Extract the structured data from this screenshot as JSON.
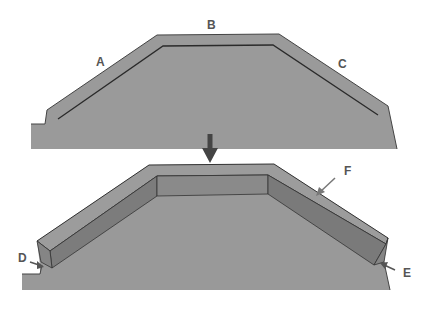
{
  "diagram": {
    "top_view": {
      "labels": [
        {
          "id": "A",
          "text": "A"
        },
        {
          "id": "B",
          "text": "B"
        },
        {
          "id": "C",
          "text": "C"
        }
      ]
    },
    "bottom_view": {
      "labels": [
        {
          "id": "D",
          "text": "D"
        },
        {
          "id": "E",
          "text": "E"
        },
        {
          "id": "F",
          "text": "F"
        }
      ]
    },
    "colors": {
      "background": "#ffffff",
      "ground_fill": "#999999",
      "outline": "#333333",
      "beam_top": "#9c9c9c",
      "beam_side": "#7a7a7a",
      "beam_end": "#858585",
      "arrow": "#444444",
      "label": "#555555"
    }
  }
}
